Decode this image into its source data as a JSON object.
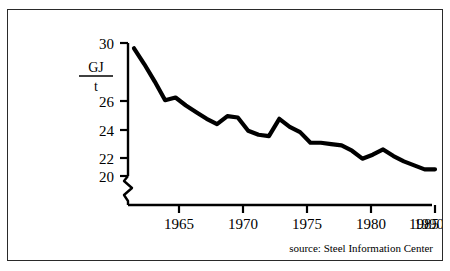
{
  "figure": {
    "source_note": "source: Steel Information Center",
    "unit_numerator": "GJ",
    "unit_denominator": "t",
    "line_color": "#000000",
    "axis_color": "#000000",
    "background_color": "#ffffff",
    "border_color": "#2a2a2a"
  },
  "chart_data": {
    "type": "line",
    "title": "",
    "subtitle": "",
    "xlabel": "",
    "ylabel": "GJ/t",
    "xlim": [
      1961,
      1990
    ],
    "ylim": [
      19.6,
      30.0
    ],
    "y_axis_break": true,
    "y_axis_break_below": 20,
    "grid": false,
    "legend": null,
    "annotations": [
      "source: Steel Information Center"
    ],
    "xticks": [
      1965,
      1970,
      1975,
      1980,
      1985,
      1990
    ],
    "xticklabels": [
      "1965",
      "1970",
      "1975",
      "1980",
      "1985",
      "1990"
    ],
    "yticks": [
      20,
      22,
      24,
      26,
      30
    ],
    "yticklabels": [
      "20",
      "22",
      "24",
      "26",
      "30"
    ],
    "series": [
      {
        "name": "Specific energy consumption",
        "units": "GJ/t",
        "x": [
          1961,
          1962,
          1963,
          1964,
          1965,
          1966,
          1967,
          1968,
          1969,
          1970,
          1971,
          1972,
          1973,
          1974,
          1975,
          1976,
          1977,
          1978,
          1979,
          1980,
          1981,
          1982,
          1983,
          1984,
          1985,
          1986,
          1987,
          1988,
          1989,
          1990
        ],
        "values": [
          29.6,
          28.4,
          27.1,
          25.7,
          25.9,
          25.3,
          24.8,
          24.3,
          23.9,
          24.5,
          24.4,
          23.4,
          23.1,
          23.0,
          24.3,
          23.7,
          23.3,
          22.5,
          22.5,
          22.4,
          22.3,
          21.9,
          21.3,
          21.6,
          22.0,
          21.5,
          21.1,
          20.8,
          20.5,
          20.5
        ]
      }
    ]
  }
}
